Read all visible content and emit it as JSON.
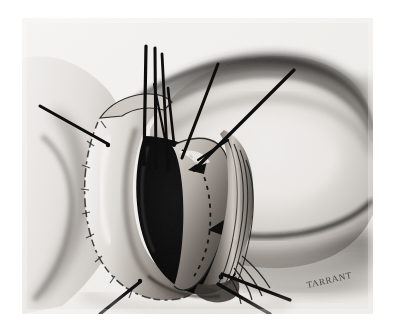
{
  "figure": {
    "kind": "surgical-illustration",
    "medium": "charcoal-pencil-halftone",
    "signature": "TARRANT",
    "background_color": "#ffffff",
    "plate_color": "#f2f1ef",
    "ink_color": "#111111",
    "shadow_color": "#4a4a4a",
    "cavity_color": "#080808",
    "plate": {
      "x": 22,
      "y": 18,
      "width": 351,
      "height": 296
    },
    "elements": {
      "anatomy_mass_label": "rounded anatomical mass",
      "incision_label": "open surgical incision",
      "cavity_label": "dark incision cavity",
      "retraction_sutures_label": "retraction suture threads",
      "dashed_line_label": "dashed dissection line",
      "arrow_label": "direction arrow",
      "skin_edge_label": "everted skin edge"
    },
    "suture_count": 9
  }
}
